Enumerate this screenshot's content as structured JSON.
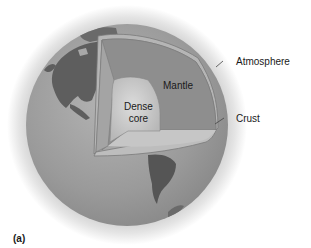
{
  "figure": {
    "panel_label": "(a)"
  },
  "labels": {
    "atmosphere": "Atmosphere",
    "crust": "Crust",
    "mantle": "Mantle",
    "core_line1": "Dense",
    "core_line2": "core"
  },
  "colors": {
    "background": "#ffffff",
    "atmosphere_halo": "#d9d9d9",
    "ocean": "#9a9a9a",
    "land": "#5c5c5c",
    "mantle": "#8a8a8a",
    "crust_cut": "#b5b5b5",
    "core": "#c8c8c8",
    "text": "#1a1a1a"
  }
}
